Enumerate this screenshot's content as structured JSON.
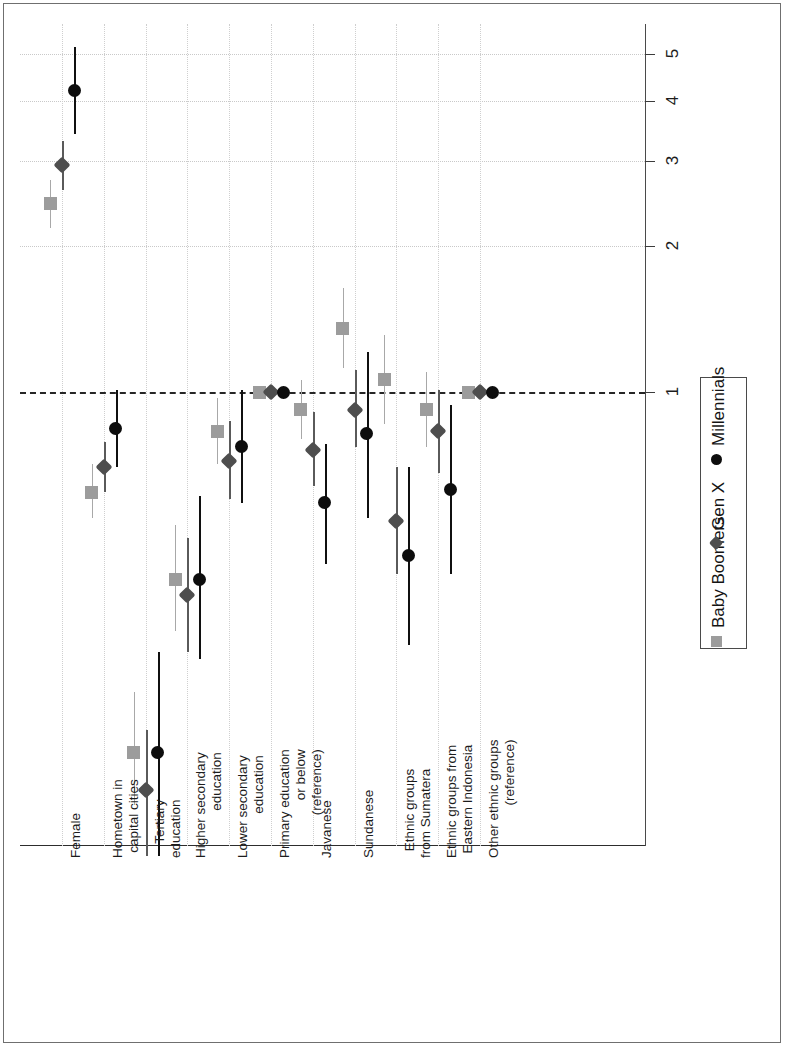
{
  "chart_data": {
    "type": "scatter",
    "plot_style": "forest-plot-odds-ratios-rotated",
    "title": "",
    "subtitle": "",
    "xlabel": "",
    "ylabel": "",
    "orientation": "horizontal-categories-rotated-90",
    "value_axis": {
      "scale": "log",
      "ticks": [
        1,
        2,
        3,
        4,
        5
      ],
      "tick_labels": [
        "1",
        "2",
        "3",
        "4",
        "5"
      ],
      "lim": [
        0.1,
        5.6
      ],
      "reference_value": 1,
      "reference_line_style": "dashed"
    },
    "grid": true,
    "grid_style": "dotted",
    "legend_position": "right",
    "legend": [
      {
        "name": "Baby Boomers",
        "marker": "square",
        "color": "#9c9c9c"
      },
      {
        "name": "Gen X",
        "marker": "diamond",
        "color": "#4e4e4e"
      },
      {
        "name": "Millennials",
        "marker": "circle",
        "color": "#0d0d0d"
      }
    ],
    "categories": [
      "Female",
      "Hometown in capital cities",
      "Tertiary education",
      "Higher secondary education",
      "Lower secondary education",
      "Primary education or below (reference)",
      "Javanese",
      "Sundanese",
      "Ethnic groups from Sumatera",
      "Ethnic groups from Eastern Indonesia",
      "Other ethnic groups (reference)"
    ],
    "series": [
      {
        "name": "Baby Boomers",
        "values": [
          2.45,
          0.62,
          0.18,
          0.41,
          0.83,
          1.0,
          0.92,
          1.35,
          1.06,
          0.92,
          1.0
        ],
        "ci_low": [
          2.18,
          0.55,
          0.14,
          0.32,
          0.71,
          1.0,
          0.8,
          1.12,
          0.86,
          0.77,
          1.0
        ],
        "ci_high": [
          2.75,
          0.71,
          0.24,
          0.53,
          0.97,
          1.0,
          1.06,
          1.64,
          1.31,
          1.1,
          1.0
        ]
      },
      {
        "name": "Gen X",
        "values": [
          2.95,
          0.7,
          0.15,
          0.38,
          0.72,
          1.0,
          0.76,
          0.92,
          0.54,
          0.83,
          1.0
        ],
        "ci_low": [
          2.62,
          0.62,
          0.11,
          0.29,
          0.6,
          1.0,
          0.64,
          0.77,
          0.42,
          0.68,
          1.0
        ],
        "ci_high": [
          3.3,
          0.79,
          0.2,
          0.5,
          0.87,
          1.0,
          0.91,
          1.11,
          0.7,
          1.01,
          1.0
        ]
      },
      {
        "name": "Millennials",
        "values": [
          4.2,
          0.84,
          0.18,
          0.41,
          0.77,
          1.0,
          0.59,
          0.82,
          0.46,
          0.63,
          1.0
        ],
        "ci_low": [
          3.42,
          0.7,
          0.11,
          0.28,
          0.59,
          1.0,
          0.44,
          0.55,
          0.3,
          0.42,
          1.0
        ],
        "ci_high": [
          5.18,
          1.01,
          0.29,
          0.61,
          1.01,
          1.0,
          0.78,
          1.21,
          0.7,
          0.94,
          1.0
        ]
      }
    ]
  },
  "legend_box": {
    "items": [
      "Baby Boomers",
      "Gen X",
      "Millennials"
    ]
  },
  "axis": {
    "tick_labels": [
      "1",
      "2",
      "3",
      "4",
      "5"
    ]
  },
  "category_labels": [
    [
      "Female"
    ],
    [
      "Hometown in",
      "capital cities"
    ],
    [
      "Tertiary",
      "education"
    ],
    [
      "Higher secondary",
      "education"
    ],
    [
      "Lower secondary",
      "education"
    ],
    [
      "Primary education",
      "or below",
      "(reference)"
    ],
    [
      "Javanese"
    ],
    [
      "Sundanese"
    ],
    [
      "Ethnic groups",
      "from Sumatera"
    ],
    [
      "Ethnic groups from",
      "Eastern Indonesia"
    ],
    [
      "Other ethnic groups",
      "(reference)"
    ]
  ]
}
